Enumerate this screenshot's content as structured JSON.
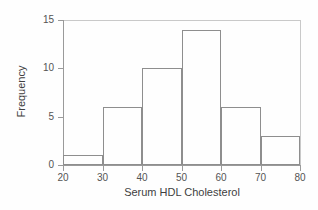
{
  "chart_data": {
    "type": "bar",
    "title": "",
    "subtitle": "",
    "xlabel": "Serum HDL Cholesterol",
    "ylabel": "Frequency",
    "xlim": [
      20,
      80
    ],
    "ylim": [
      0,
      15
    ],
    "grid": false,
    "legend": null,
    "bin_width": 10,
    "bin_edges": [
      20,
      30,
      40,
      50,
      60,
      70,
      80
    ],
    "categories": [
      "20-30",
      "30-40",
      "40-50",
      "50-60",
      "60-70",
      "70-80"
    ],
    "values": [
      1,
      6,
      10,
      14,
      6,
      3
    ],
    "xticks": [
      20,
      30,
      40,
      50,
      60,
      70,
      80
    ],
    "xticklabels": [
      "20",
      "30",
      "40",
      "50",
      "60",
      "70",
      "80"
    ],
    "yticks": [
      0,
      5,
      10,
      15
    ],
    "yticklabels": [
      "0",
      "5",
      "10",
      "15"
    ],
    "bar_edge_color": "#8e8e8e",
    "bar_fill_color": "transparent",
    "axis_color": "#9a9a9a",
    "background_color": "#fefefe",
    "text_color": "#3f3f3f"
  }
}
